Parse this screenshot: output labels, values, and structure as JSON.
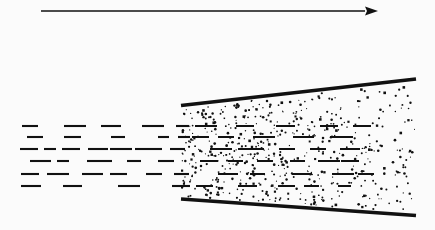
{
  "figure": {
    "background_color": "#fbfbfb",
    "ink_color": "#111111",
    "width": 435,
    "height": 230
  },
  "flow_arrow": {
    "name": "flow-direction-arrow",
    "label": "",
    "x1": 41,
    "y1": 11,
    "x2": 378,
    "y2": 11,
    "stroke_width": 1.6,
    "head_length": 13,
    "head_width": 9
  },
  "boundaries": {
    "upper_wall": {
      "name": "upper-boundary-line",
      "x1": 181,
      "y1": 105.5,
      "x2": 416,
      "y2": 79,
      "stroke_width": 3.4
    },
    "lower_wall": {
      "name": "lower-boundary-line",
      "x1": 181,
      "y1": 199,
      "x2": 416,
      "y2": 215.5,
      "stroke_width": 3.4
    },
    "inlet_x": 182,
    "outlet_x": 415
  },
  "stipple_region": {
    "name": "stippled-mixing-region",
    "dot_count": 560,
    "dot_radius_min": 0.55,
    "dot_radius_max": 1.35,
    "density_falloff": 0.45,
    "seed": 1377
  },
  "dash_rows": {
    "name": "streamline-dashes",
    "stroke_width": 2.1,
    "left_region": [
      {
        "y": 126,
        "dashes": [
          [
            22,
            16
          ],
          [
            64,
            22
          ],
          [
            101,
            20
          ],
          [
            142,
            22
          ],
          [
            176,
            13
          ]
        ]
      },
      {
        "y": 137,
        "dashes": [
          [
            27,
            16
          ],
          [
            64,
            17
          ],
          [
            111,
            14
          ],
          [
            158,
            11
          ],
          [
            178,
            12
          ]
        ]
      },
      {
        "y": 149,
        "dashes": [
          [
            20,
            18
          ],
          [
            44,
            12
          ],
          [
            62,
            18
          ],
          [
            88,
            20
          ],
          [
            110,
            22
          ],
          [
            135,
            27
          ],
          [
            170,
            15
          ]
        ]
      },
      {
        "y": 161,
        "dashes": [
          [
            30,
            21
          ],
          [
            57,
            12
          ],
          [
            87,
            25
          ],
          [
            127,
            14
          ],
          [
            158,
            16
          ]
        ]
      },
      {
        "y": 174,
        "dashes": [
          [
            21,
            18
          ],
          [
            47,
            22
          ],
          [
            82,
            21
          ],
          [
            110,
            17
          ],
          [
            146,
            16
          ],
          [
            174,
            15
          ]
        ]
      },
      {
        "y": 186,
        "dashes": [
          [
            21,
            20
          ],
          [
            63,
            19
          ],
          [
            118,
            22
          ],
          [
            172,
            18
          ]
        ]
      }
    ],
    "cone_region": [
      {
        "y": 126,
        "dashes": [
          [
            195,
            22
          ],
          [
            236,
            18
          ],
          [
            276,
            19
          ],
          [
            320,
            18
          ],
          [
            353,
            18
          ]
        ]
      },
      {
        "y": 137,
        "dashes": [
          [
            192,
            17
          ],
          [
            218,
            16
          ],
          [
            253,
            22
          ],
          [
            293,
            21
          ],
          [
            330,
            23
          ]
        ]
      },
      {
        "y": 149,
        "dashes": [
          [
            210,
            22
          ],
          [
            238,
            26
          ],
          [
            279,
            16
          ],
          [
            310,
            16
          ],
          [
            340,
            20
          ]
        ]
      },
      {
        "y": 161,
        "dashes": [
          [
            200,
            18
          ],
          [
            228,
            15
          ],
          [
            257,
            16
          ],
          [
            290,
            15
          ],
          [
            318,
            22
          ],
          [
            341,
            18
          ]
        ]
      },
      {
        "y": 174,
        "dashes": [
          [
            218,
            20
          ],
          [
            250,
            15
          ],
          [
            292,
            20
          ],
          [
            332,
            22
          ],
          [
            358,
            16
          ]
        ]
      },
      {
        "y": 186,
        "dashes": [
          [
            196,
            17
          ],
          [
            238,
            19
          ],
          [
            278,
            17
          ],
          [
            304,
            15
          ],
          [
            338,
            13
          ]
        ]
      }
    ]
  }
}
